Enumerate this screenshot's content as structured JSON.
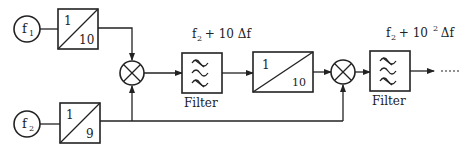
{
  "diagram": {
    "type": "block-diagram",
    "colors": {
      "stroke": "#222222",
      "background": "#ffffff"
    },
    "sources": [
      {
        "id": "f1",
        "label": "f",
        "subscript": "1"
      },
      {
        "id": "f2",
        "label": "f",
        "subscript": "2"
      }
    ],
    "dividers": [
      {
        "id": "div1",
        "numerator": "1",
        "denominator": "10"
      },
      {
        "id": "div2",
        "numerator": "1",
        "denominator": "9"
      },
      {
        "id": "div3",
        "numerator": "1",
        "denominator": "10"
      }
    ],
    "mixers": [
      {
        "id": "mix1",
        "symbol": "multiply"
      },
      {
        "id": "mix2",
        "symbol": "multiply"
      }
    ],
    "filters": [
      {
        "id": "filter1",
        "label": "Filter",
        "freq_prefix": "f",
        "freq_sub": "2",
        "freq_rest": " + 10 Δf"
      },
      {
        "id": "filter2",
        "label": "Filter",
        "freq_prefix": "f",
        "freq_sub": "2",
        "freq_mid": " + 10",
        "freq_sup": "2",
        "freq_rest": " Δf"
      }
    ],
    "output": {
      "continuation": "- - - -"
    }
  }
}
